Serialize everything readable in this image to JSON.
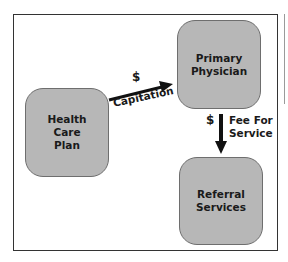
{
  "diagram": {
    "nodes": [
      {
        "id": "health-care-plan",
        "label": "Health\nCare\nPlan"
      },
      {
        "id": "primary-physician",
        "label": "Primary\nPhysician"
      },
      {
        "id": "referral-services",
        "label": "Referral\nServices"
      }
    ],
    "edges": [
      {
        "from": "health-care-plan",
        "to": "primary-physician",
        "symbol": "$",
        "label": "Capitation"
      },
      {
        "from": "primary-physician",
        "to": "referral-services",
        "symbol": "$",
        "label": "Fee For\nService"
      }
    ],
    "colors": {
      "node_fill": "#b7b7b7",
      "node_border": "#6e6e6e",
      "arrow": "#111111",
      "frame": "#333333",
      "text": "#1a1a1a"
    }
  }
}
